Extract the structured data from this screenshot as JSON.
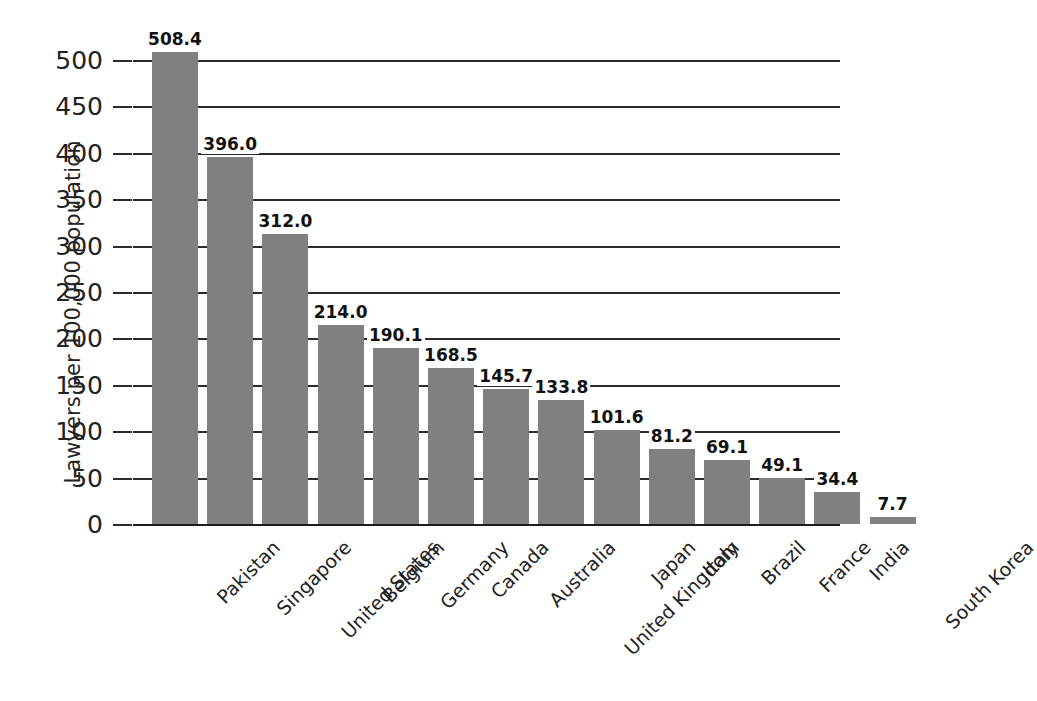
{
  "chart_data": {
    "type": "bar",
    "title": "",
    "xlabel": "",
    "ylabel": "Lawyers per 100,000 population",
    "ylim": [
      0,
      500
    ],
    "ytick_step": 50,
    "grid": true,
    "legend": null,
    "bar_color": "#808080",
    "axis_color": "#2b2b2b",
    "categories": [
      "Pakistan",
      "Singapore",
      "United States",
      "Belgium",
      "Germany",
      "Canada",
      "Australia",
      "United Kingdom",
      "Japan",
      "Italy",
      "Brazil",
      "France",
      "India",
      "South Korea"
    ],
    "values": [
      508.4,
      396.0,
      312.0,
      214.0,
      190.1,
      168.5,
      145.7,
      133.8,
      101.6,
      81.2,
      69.1,
      49.1,
      34.4,
      7.7
    ],
    "value_labels": [
      "508.4",
      "396.0",
      "312.0",
      "214.0",
      "190.1",
      "168.5",
      "145.7",
      "133.8",
      "101.6",
      "81.2",
      "69.1",
      "49.1",
      "34.4",
      "7.7"
    ],
    "ytick_labels": [
      "0",
      "50",
      "100",
      "150",
      "200",
      "250",
      "300",
      "350",
      "400",
      "450",
      "500"
    ],
    "ytick_values": [
      0,
      50,
      100,
      150,
      200,
      250,
      300,
      350,
      400,
      450,
      500
    ]
  }
}
